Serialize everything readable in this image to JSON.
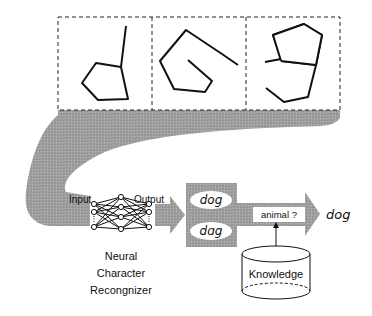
{
  "figure": {
    "input_samples": [
      {
        "id": "sample-1",
        "description": "handwritten stroke: pentagon with tail upward (d-like)"
      },
      {
        "id": "sample-2",
        "description": "handwritten stroke: pentagon with tail to right (o-like)"
      },
      {
        "id": "sample-3",
        "description": "handwritten stroke: pentagon with hook below (g-like)"
      }
    ],
    "network": {
      "input_label": "Input",
      "output_label": "Output",
      "caption_lines": [
        "Neural",
        "Character",
        "Recongnizer"
      ]
    },
    "candidates": [
      "dog",
      "dɑg"
    ],
    "query_label": "animal ?",
    "knowledge_label": "Knowledge",
    "result": "dog",
    "colors": {
      "stroke": "#111111",
      "flow_gray": "#9a9a9a",
      "box_gray": "#a3a3a3",
      "background": "#ffffff"
    }
  }
}
